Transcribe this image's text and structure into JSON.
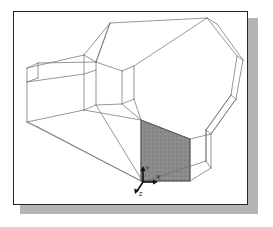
{
  "figure": {
    "title": "3D wireframe solid model with one shaded face",
    "kind": "cad-wireframe-view",
    "frame": {
      "border_color": "#262626",
      "background_color": "#ffffff",
      "shadow_color": "#b5b5b5",
      "border_width_px": 1.2,
      "x": 13,
      "y": 11,
      "width": 235,
      "height": 194
    },
    "style": {
      "wireframe_line_color": "#6b6b6b",
      "wireframe_line_width_px": 0.7,
      "shaded_face_fill": "#8a8a8a",
      "shaded_face_stroke": "#3a3a3a",
      "axis_color": "#111111"
    },
    "shaded_face": {
      "name": "highlighted-face",
      "fill_hex": "#8a8a8a",
      "points": "141,120 190,139 190,181 141,181"
    },
    "axes": {
      "label_x": "X",
      "label_y": "Y",
      "label_z": "Z",
      "origin_x": 143,
      "origin_y": 182
    },
    "wireframe_edges": [
      "110,23 207,18",
      "207,18 237,56",
      "237,56 231,95",
      "231,95 206,130",
      "110,23 84,55",
      "84,55 96,62",
      "96,62 110,23",
      "207,18 217,24",
      "217,24 243,60",
      "243,60 237,56",
      "243,60 236,99",
      "236,99 231,95",
      "236,99 211,134",
      "211,134 206,130",
      "84,55 27,68",
      "27,68 27,122",
      "27,122 84,110",
      "84,110 84,55",
      "96,62 122,71",
      "122,71 122,104",
      "122,104 96,105",
      "96,105 96,62",
      "122,71 134,66",
      "134,66 134,99",
      "134,99 122,104",
      "27,68 38,63",
      "38,63 96,62",
      "38,63 38,78",
      "38,78 27,82",
      "84,110 96,105",
      "27,122 143,182",
      "143,182 206,161",
      "206,161 206,130",
      "143,182 141,181",
      "27,122 38,127",
      "38,127 143,182",
      "134,99 141,120",
      "141,120 190,139",
      "190,139 190,181",
      "190,181 141,181",
      "141,181 141,120",
      "190,139 211,134",
      "190,181 211,168",
      "211,168 211,134",
      "206,161 211,168",
      "96,105 143,182",
      "134,66 207,18",
      "96,62 110,23",
      "122,104 141,120",
      "84,110 141,120",
      "27,82 84,74",
      "84,74 96,70",
      "231,95 206,130",
      "206,130 206,161",
      "211,134 236,99"
    ]
  }
}
